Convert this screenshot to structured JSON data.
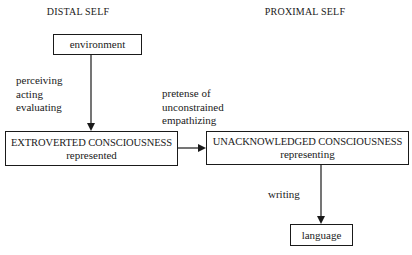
{
  "headings": {
    "left": "DISTAL SELF",
    "right": "PROXIMAL SELF"
  },
  "nodes": {
    "environment": {
      "label": "environment"
    },
    "extroverted": {
      "title": "EXTROVERTED CONSCIOUSNESS",
      "subtitle": "represented"
    },
    "unacknowledged": {
      "title": "UNACKNOWLEDGED CONSCIOUSNESS",
      "subtitle": "representing"
    },
    "language": {
      "label": "language"
    }
  },
  "edges": {
    "environment_to_extroverted": {
      "labels": [
        "perceiving",
        "acting",
        "evaluating"
      ]
    },
    "extroverted_to_unacknowledged": {
      "labels": [
        "pretense of",
        "unconstrained",
        "empathizing"
      ]
    },
    "unacknowledged_to_language": {
      "labels": [
        "writing"
      ]
    }
  },
  "colors": {
    "line": "#1a1a1a",
    "background": "#ffffff"
  }
}
